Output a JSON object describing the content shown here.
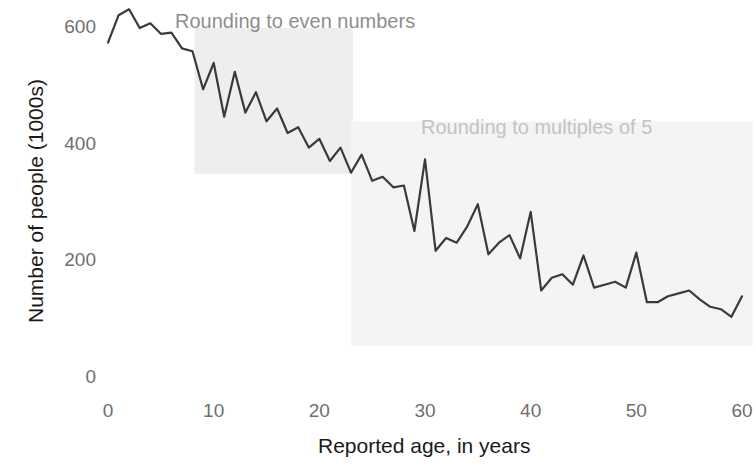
{
  "chart_data": {
    "type": "line",
    "title": "",
    "subtitle": "",
    "xlabel": "Reported age, in years",
    "ylabel": "Number of people (1000s)",
    "xlim": [
      0,
      60
    ],
    "ylim": [
      0,
      660
    ],
    "xticks": [
      0,
      10,
      20,
      30,
      40,
      50,
      60
    ],
    "xtick_labels": [
      "0",
      "10",
      "20",
      "30",
      "40",
      "50",
      "60"
    ],
    "yticks": [
      0,
      200,
      400,
      600
    ],
    "ytick_labels": [
      "0",
      "200",
      "400",
      "600"
    ],
    "grid": false,
    "legend": "none",
    "line_color": "#3a3a3a",
    "x": [
      0,
      1,
      2,
      3,
      4,
      5,
      6,
      7,
      8,
      9,
      10,
      11,
      12,
      13,
      14,
      15,
      16,
      17,
      18,
      19,
      20,
      21,
      22,
      23,
      24,
      25,
      26,
      27,
      28,
      29,
      30,
      31,
      32,
      33,
      34,
      35,
      36,
      37,
      38,
      39,
      40,
      41,
      42,
      43,
      44,
      45,
      46,
      47,
      48,
      49,
      50,
      51,
      52,
      53,
      54,
      55,
      56,
      57,
      58,
      59,
      60
    ],
    "values": [
      575,
      622,
      632,
      600,
      608,
      590,
      592,
      565,
      560,
      495,
      540,
      448,
      525,
      455,
      490,
      440,
      462,
      420,
      430,
      395,
      410,
      372,
      395,
      352,
      383,
      338,
      345,
      327,
      330,
      252,
      375,
      218,
      240,
      232,
      260,
      298,
      212,
      232,
      245,
      205,
      285,
      150,
      172,
      178,
      160,
      210,
      155,
      160,
      165,
      155,
      215,
      130,
      130,
      140,
      145,
      150,
      135,
      122,
      118,
      105,
      140
    ],
    "annotations": [
      {
        "text": "Rounding to even numbers",
        "x_range": [
          8.2,
          23.2
        ],
        "y_range": [
          350,
          600
        ],
        "band_color": "#eeeeee",
        "label_color": "#8d8d8d"
      },
      {
        "text": "Rounding to multiples of 5",
        "x_range": [
          23.0,
          61.0
        ],
        "y_range": [
          55,
          440
        ],
        "band_color": "#f4f4f4",
        "label_color": "#c3c3c3"
      }
    ]
  }
}
